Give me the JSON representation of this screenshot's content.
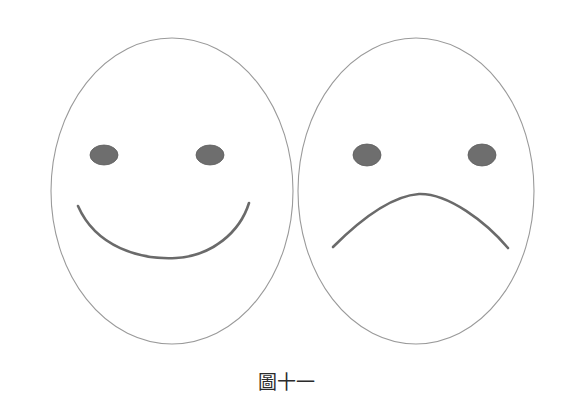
{
  "figure": {
    "caption": "圖十一",
    "background_color": "#ffffff",
    "width": 572,
    "height": 408,
    "outline_color": "#9a9a9a",
    "eye_fill_color": "#6e6e6e",
    "eye_stroke_color": "#5a5a5a",
    "mouth_color": "#6b6b6b",
    "caption_color": "#2b2b2b"
  },
  "faces": [
    {
      "id": "happy-face",
      "name": "smiling-face",
      "expression": "happy",
      "mouth_type": "smile-curve-upward",
      "head": {
        "cx": 172,
        "cy": 191,
        "rx": 121,
        "ry": 153
      },
      "eyes": [
        {
          "side": "left",
          "cx": 104,
          "cy": 155,
          "rx": 14,
          "ry": 10
        },
        {
          "side": "right",
          "cx": 210,
          "cy": 155,
          "rx": 14,
          "ry": 10
        }
      ],
      "mouth": {
        "x1": 78,
        "y1": 206,
        "x2": 249,
        "y2": 203,
        "depth": 256
      }
    },
    {
      "id": "sad-face",
      "name": "frowning-face",
      "expression": "sad",
      "mouth_type": "frown-curve-downward",
      "head": {
        "cx": 416,
        "cy": 191,
        "rx": 118,
        "ry": 153
      },
      "eyes": [
        {
          "side": "left",
          "cx": 367,
          "cy": 155,
          "rx": 14,
          "ry": 11
        },
        {
          "side": "right",
          "cx": 482,
          "cy": 155,
          "rx": 14,
          "ry": 11
        }
      ],
      "mouth": {
        "x1": 333,
        "y1": 247,
        "x2": 508,
        "y2": 248,
        "peak": 195
      }
    }
  ]
}
